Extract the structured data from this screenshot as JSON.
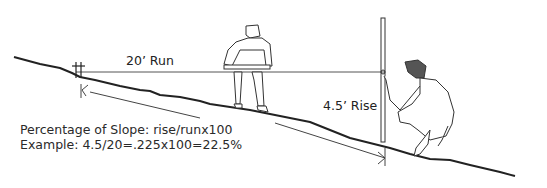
{
  "diagram": {
    "labels": {
      "run": "20’ Run",
      "rise": "4.5’ Rise"
    },
    "formula": {
      "line1": "Percentage of Slope: rise/runx100",
      "line2": "Example: 4.5/20=.225x100=22.5%"
    },
    "elements": [
      "ground-slope-line",
      "level-string-line",
      "stake",
      "measuring-pole",
      "standing-person-with-level",
      "crouching-person-holding-pole",
      "run-arrow"
    ],
    "colors": {
      "ink": "#222222",
      "background": "#ffffff"
    }
  }
}
